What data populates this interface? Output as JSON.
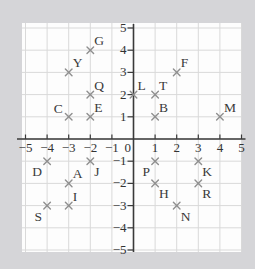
{
  "page": {
    "background_color": "#d5d5d8"
  },
  "chart_data": {
    "type": "scatter",
    "title": "",
    "xlabel": "",
    "ylabel": "",
    "xlim": [
      -5,
      5
    ],
    "ylim": [
      -5,
      5
    ],
    "x_tick_labels": [
      "-5",
      "-4",
      "-3",
      "-2",
      "-1",
      "1",
      "2",
      "3",
      "4",
      "5"
    ],
    "y_tick_labels": [
      "-5",
      "-4",
      "-3",
      "-2",
      "-1",
      "1",
      "2",
      "3",
      "4",
      "5"
    ],
    "origin_label": "0",
    "grid": true,
    "legend": false,
    "marker_glyph": "x",
    "colors": {
      "page_bg": "#d5d5d8",
      "plot_bg": "#fdfdfd",
      "grid": "#d9d9d9",
      "axis": "#3a3a3a",
      "tick_label": "#333333",
      "marker": "#8f8f8f",
      "point_label": "#3a3a3a"
    },
    "points": [
      {
        "label": "G",
        "x": -2,
        "y": 4,
        "label_pos": "above-right"
      },
      {
        "label": "Y",
        "x": -3,
        "y": 3,
        "label_pos": "above-right"
      },
      {
        "label": "F",
        "x": 2,
        "y": 3,
        "label_pos": "above-right"
      },
      {
        "label": "Q",
        "x": -2,
        "y": 2,
        "label_pos": "above-right"
      },
      {
        "label": "L",
        "x": 0,
        "y": 2,
        "label_pos": "above-right"
      },
      {
        "label": "T",
        "x": 1,
        "y": 2,
        "label_pos": "above-right"
      },
      {
        "label": "C",
        "x": -3,
        "y": 1,
        "label_pos": "above-left"
      },
      {
        "label": "E",
        "x": -2,
        "y": 1,
        "label_pos": "above-right"
      },
      {
        "label": "B",
        "x": 1,
        "y": 1,
        "label_pos": "above-right"
      },
      {
        "label": "M",
        "x": 4,
        "y": 1,
        "label_pos": "above-right"
      },
      {
        "label": "D",
        "x": -4,
        "y": -1,
        "label_pos": "below-left"
      },
      {
        "label": "J",
        "x": -2,
        "y": -1,
        "label_pos": "below-right"
      },
      {
        "label": "P",
        "x": 1,
        "y": -1,
        "label_pos": "below-left"
      },
      {
        "label": "K",
        "x": 3,
        "y": -1,
        "label_pos": "below-right"
      },
      {
        "label": "A",
        "x": -3,
        "y": -2,
        "label_pos": "above-right"
      },
      {
        "label": "H",
        "x": 1,
        "y": -2,
        "label_pos": "below-right"
      },
      {
        "label": "R",
        "x": 3,
        "y": -2,
        "label_pos": "below-right"
      },
      {
        "label": "I",
        "x": -3,
        "y": -3,
        "label_pos": "above-right"
      },
      {
        "label": "S",
        "x": -4,
        "y": -3,
        "label_pos": "below-left"
      },
      {
        "label": "N",
        "x": 2,
        "y": -3,
        "label_pos": "below-right"
      }
    ]
  }
}
